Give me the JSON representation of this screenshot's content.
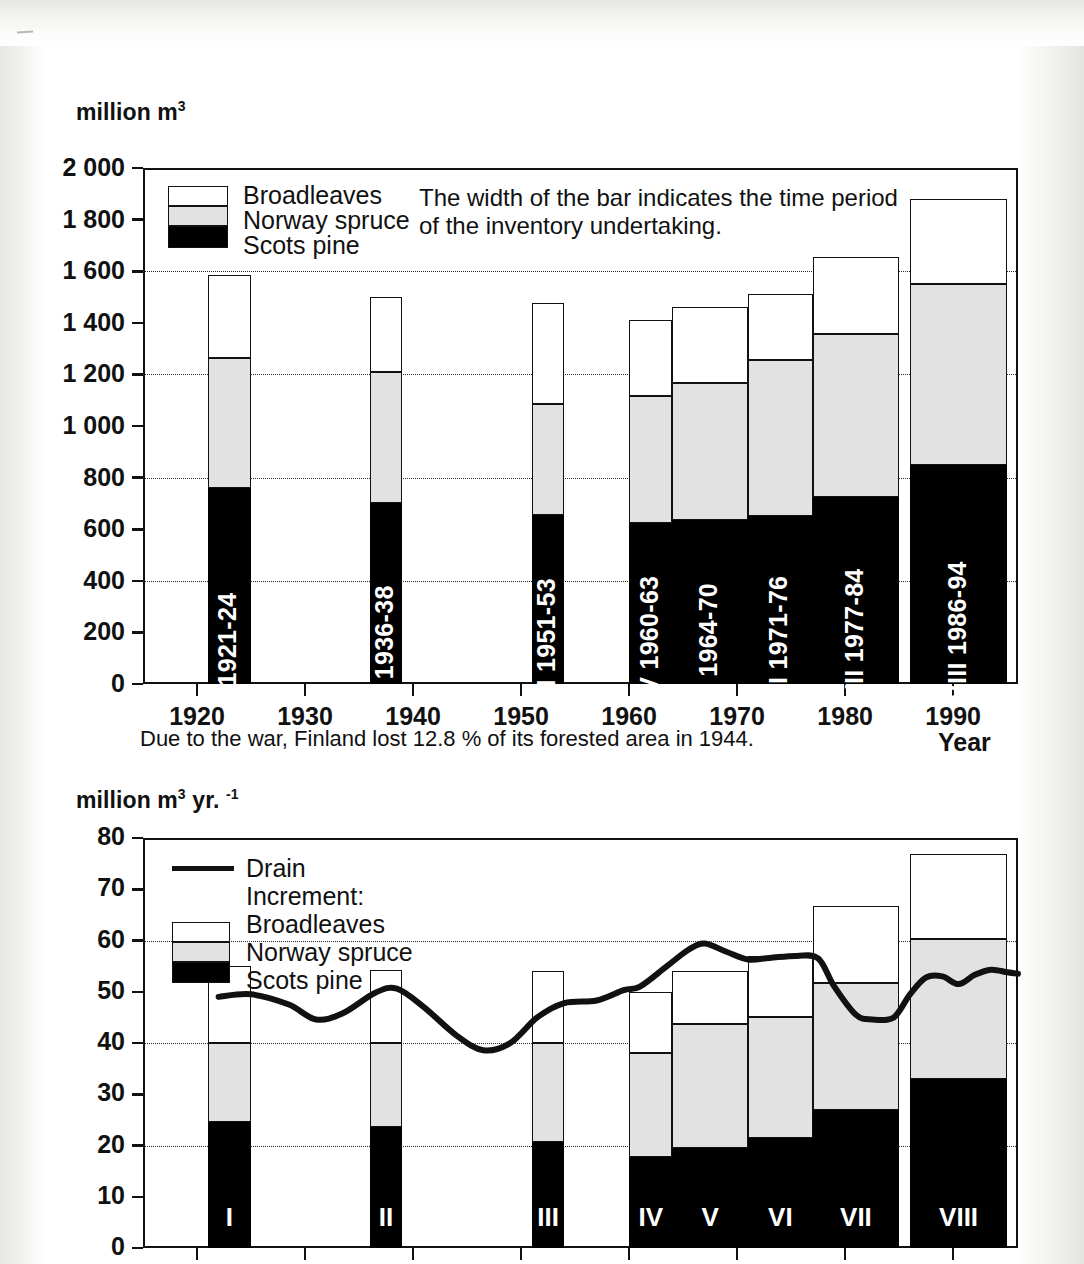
{
  "page": {
    "background_color": "#ffffff",
    "ink_color": "#111111"
  },
  "chart_data": [
    {
      "id": "growing-stock",
      "type": "bar",
      "stacked": true,
      "title": "",
      "ylabel": "million m3",
      "ylabel_html": "million m<sup>3</sup>",
      "xlabel": "Year",
      "ylim": [
        0,
        2000
      ],
      "ytick_labels": [
        "2 000",
        "1 800",
        "1 600",
        "1 400",
        "1 200",
        "1 000",
        "800",
        "600",
        "400",
        "200",
        "0"
      ],
      "ytick_values": [
        2000,
        1800,
        1600,
        1400,
        1200,
        1000,
        800,
        600,
        400,
        200,
        0
      ],
      "gridlines_at": [
        1600,
        1200,
        800,
        400
      ],
      "grid": true,
      "xtick_labels": [
        "1920",
        "1930",
        "1940",
        "1950",
        "1960",
        "1970",
        "1980",
        "1990"
      ],
      "xtick_values": [
        1920,
        1930,
        1940,
        1950,
        1960,
        1970,
        1980,
        1990
      ],
      "xlim": [
        1915,
        1996
      ],
      "legend": {
        "position": "upper-left-inside",
        "entries": [
          "Broadleaves",
          "Norway spruce",
          "Scots pine"
        ]
      },
      "annotation": {
        "line1": "The width of the bar indicates the time period",
        "line2": "of the inventory undertaking."
      },
      "caption": "Due to the war, Finland lost 12.8 % of its forested area in 1944.",
      "series": [
        {
          "name": "Scots pine",
          "values": [
            760,
            700,
            655,
            625,
            635,
            650,
            725,
            850
          ]
        },
        {
          "name": "Norway spruce",
          "values": [
            505,
            510,
            430,
            490,
            530,
            605,
            630,
            700
          ]
        },
        {
          "name": "Broadleaves",
          "values": [
            320,
            290,
            390,
            295,
            295,
            255,
            300,
            330
          ]
        }
      ],
      "totals": [
        1585,
        1500,
        1475,
        1410,
        1460,
        1510,
        1655,
        1880
      ],
      "bars": [
        {
          "label": "I 1921-24",
          "roman": "I",
          "period": "1921-24",
          "x_start": 1921,
          "x_end": 1924,
          "pine": 760,
          "spruce_top": 1265,
          "total": 1585
        },
        {
          "label": "II 1936-38",
          "roman": "II",
          "period": "1936-38",
          "x_start": 1936,
          "x_end": 1938,
          "pine": 700,
          "spruce_top": 1210,
          "total": 1500
        },
        {
          "label": "III 1951-53",
          "roman": "III",
          "period": "1951-53",
          "x_start": 1951,
          "x_end": 1953,
          "pine": 655,
          "spruce_top": 1085,
          "total": 1475
        },
        {
          "label": "IV 1960-63",
          "roman": "IV",
          "period": "1960-63",
          "x_start": 1960,
          "x_end": 1963,
          "pine": 625,
          "spruce_top": 1115,
          "total": 1410
        },
        {
          "label": "V 1964-70",
          "roman": "V",
          "period": "1964-70",
          "x_start": 1964,
          "x_end": 1970,
          "pine": 635,
          "spruce_top": 1165,
          "total": 1460
        },
        {
          "label": "VI 1971-76",
          "roman": "VI",
          "period": "1971-76",
          "x_start": 1971,
          "x_end": 1976,
          "pine": 650,
          "spruce_top": 1255,
          "total": 1510
        },
        {
          "label": "VII 1977-84",
          "roman": "VII",
          "period": "1977-84",
          "x_start": 1977,
          "x_end": 1984,
          "pine": 725,
          "spruce_top": 1355,
          "total": 1655
        },
        {
          "label": "VIII 1986-94",
          "roman": "VIII",
          "period": "1986-94",
          "x_start": 1986,
          "x_end": 1994,
          "pine": 850,
          "spruce_top": 1550,
          "total": 1880
        }
      ]
    },
    {
      "id": "increment-and-drain",
      "type": "bar",
      "stacked": true,
      "overlay": "line",
      "title": "",
      "ylabel": "million m3 yr. -1",
      "ylabel_html": "million m<sup>3</sup> yr. <sup>-1</sup>",
      "xlabel": "",
      "ylim": [
        0,
        80
      ],
      "ytick_labels": [
        "80",
        "70",
        "60",
        "50",
        "40",
        "30",
        "20",
        "10",
        "0"
      ],
      "ytick_values": [
        80,
        70,
        60,
        50,
        40,
        30,
        20,
        10,
        0
      ],
      "gridlines_at": [
        60,
        40,
        20
      ],
      "grid": true,
      "legend": {
        "position": "upper-left-inside",
        "line_entry": "Drain",
        "group_label": "Increment:",
        "entries": [
          "Broadleaves",
          "Norway spruce",
          "Scots pine"
        ]
      },
      "series": [
        {
          "name": "Scots pine",
          "values": [
            24.5,
            23.7,
            20.7,
            17.8,
            19.5,
            21.5,
            27.0,
            33.0
          ]
        },
        {
          "name": "Norway spruce",
          "values": [
            15.5,
            16.3,
            19.3,
            20.2,
            24.3,
            23.5,
            24.8,
            27.3
          ]
        },
        {
          "name": "Broadleaves",
          "values": [
            15.0,
            14.3,
            14.0,
            12.0,
            10.2,
            12.0,
            15.0,
            16.5
          ]
        }
      ],
      "totals": [
        55.0,
        54.3,
        54.0,
        50.0,
        54.0,
        57.0,
        66.8,
        76.8
      ],
      "bars": [
        {
          "roman": "I",
          "pine": 24.5,
          "spruce_top": 40.0,
          "total": 55.0
        },
        {
          "roman": "II",
          "pine": 23.7,
          "spruce_top": 40.0,
          "total": 54.3
        },
        {
          "roman": "III",
          "pine": 20.7,
          "spruce_top": 40.0,
          "total": 54.0
        },
        {
          "roman": "IV",
          "pine": 17.8,
          "spruce_top": 38.0,
          "total": 50.0
        },
        {
          "roman": "V",
          "pine": 19.5,
          "spruce_top": 43.8,
          "total": 54.0
        },
        {
          "roman": "VI",
          "pine": 21.5,
          "spruce_top": 45.0,
          "total": 57.0
        },
        {
          "roman": "VII",
          "pine": 27.0,
          "spruce_top": 51.8,
          "total": 66.8
        },
        {
          "roman": "VIII",
          "pine": 33.0,
          "spruce_top": 60.3,
          "total": 76.8
        }
      ],
      "drain_line": {
        "name": "Drain",
        "points": [
          [
            1922.0,
            49.0
          ],
          [
            1925.0,
            49.5
          ],
          [
            1928.5,
            47.5
          ],
          [
            1931.0,
            44.6
          ],
          [
            1933.5,
            45.8
          ],
          [
            1936.5,
            49.8
          ],
          [
            1938.5,
            50.6
          ],
          [
            1941.0,
            47.0
          ],
          [
            1944.0,
            41.5
          ],
          [
            1946.5,
            38.6
          ],
          [
            1949.0,
            40.0
          ],
          [
            1951.5,
            45.0
          ],
          [
            1954.0,
            47.8
          ],
          [
            1957.0,
            48.3
          ],
          [
            1959.5,
            50.3
          ],
          [
            1961.0,
            51.0
          ],
          [
            1963.5,
            55.0
          ],
          [
            1965.5,
            58.2
          ],
          [
            1967.0,
            59.4
          ],
          [
            1969.0,
            57.8
          ],
          [
            1971.0,
            56.3
          ],
          [
            1973.0,
            56.6
          ],
          [
            1975.5,
            57.0
          ],
          [
            1977.5,
            56.5
          ],
          [
            1979.0,
            51.0
          ],
          [
            1981.0,
            45.5
          ],
          [
            1982.5,
            44.6
          ],
          [
            1984.5,
            45.0
          ],
          [
            1986.0,
            49.5
          ],
          [
            1987.5,
            52.8
          ],
          [
            1989.0,
            53.0
          ],
          [
            1990.5,
            51.5
          ],
          [
            1992.0,
            53.3
          ],
          [
            1993.5,
            54.3
          ],
          [
            1995.0,
            53.8
          ],
          [
            1996.0,
            53.5
          ]
        ]
      }
    }
  ],
  "chart1": {
    "unit_prefix": "million m",
    "unit_sup": "3",
    "x_axis_title": "Year",
    "legend": {
      "broadleaves": "Broadleaves",
      "norway_spruce": "Norway spruce",
      "scots_pine": "Scots pine"
    },
    "note_line1": "The width of the bar indicates the time period",
    "note_line2": "of the inventory undertaking.",
    "caption": "Due to the war, Finland lost 12.8 % of its forested area in 1944."
  },
  "chart2": {
    "unit_prefix": "million m",
    "unit_sup": "3",
    "unit_mid": " yr. ",
    "unit_sup2": "-1",
    "legend": {
      "drain": "Drain",
      "increment": "Increment:",
      "broadleaves": "Broadleaves",
      "norway_spruce": "Norway spruce",
      "scots_pine": "Scots pine"
    }
  }
}
